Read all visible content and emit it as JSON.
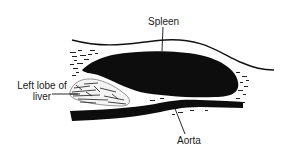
{
  "diagram": {
    "type": "anatomical-illustration",
    "labels": {
      "spleen": "Spleen",
      "aorta": "Aorta",
      "liver_line1": "Left lobe of",
      "liver_line2": "liver"
    },
    "colors": {
      "ink": "#0d0d0d",
      "background": "#ffffff",
      "text": "#1a1a1a"
    }
  }
}
